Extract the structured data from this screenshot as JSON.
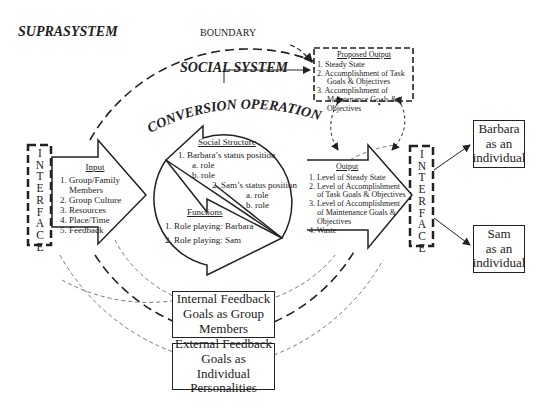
{
  "labels": {
    "suprasystem": "SUPRASYSTEM",
    "boundary": "BOUNDARY",
    "social_system": "SOCIAL SYSTEM",
    "conversion_operations": "CONVERSION OPERATIONS"
  },
  "interface_left": {
    "letters": [
      "I",
      "N",
      "T",
      "E",
      "R",
      "F",
      "A",
      "C",
      "E"
    ]
  },
  "interface_right": {
    "letters": [
      "I",
      "N",
      "T",
      "E",
      "R",
      "F",
      "A",
      "C",
      "E"
    ]
  },
  "input": {
    "title": "Input",
    "items": [
      "1. Group/Family",
      "Members",
      "2. Group Culture",
      "3. Resources",
      "4. Place/Time",
      "5. Feedback"
    ]
  },
  "social_structure": {
    "title": "Social Structure",
    "items": [
      "1. Barbara’s status position",
      "a. role",
      "b. role",
      "2. Sam’s status position",
      "a. role",
      "b. role"
    ]
  },
  "functions": {
    "title": "Functions",
    "items": [
      "1. Role playing: Barbara",
      "2. Role playing: Sam"
    ]
  },
  "proposed_output": {
    "title": "Proposed Output",
    "items": [
      "1. Steady State",
      "2. Accomplishment of Task",
      "Goals & Objectives",
      "3. Accomplishment of",
      "Maintenance Goals &",
      "Objectives"
    ]
  },
  "output": {
    "title": "Output",
    "items": [
      "1. Level of Steady State",
      "2. Level of Accomplishment",
      "of Task Goals & Objectives",
      "3. Level of Accomplishment",
      "of Maintenance Goals &",
      "Objectives",
      "4. Waste"
    ]
  },
  "barbara_box": {
    "lines": [
      "Barbara",
      "as an",
      "individual"
    ]
  },
  "sam_box": {
    "lines": [
      "Sam",
      "as an",
      "individual"
    ]
  },
  "internal_feedback": {
    "lines": [
      "Internal Feedback",
      "Goals as Group",
      "Members"
    ]
  },
  "external_feedback": {
    "lines": [
      "External Feedback",
      "Goals as Individual",
      "Personalities"
    ]
  }
}
